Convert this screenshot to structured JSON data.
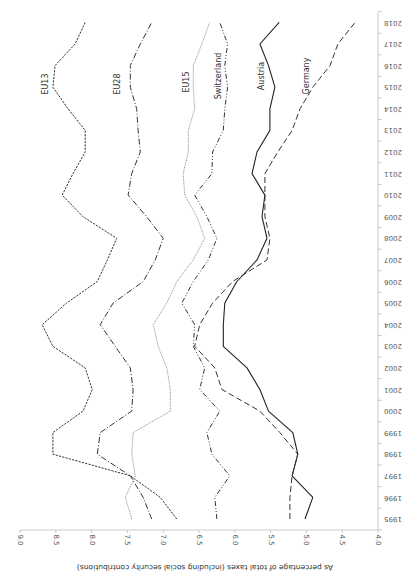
{
  "chart_data": {
    "type": "line",
    "orientation_note": "image rendered rotated 180 degrees",
    "title": "",
    "xlabel": "",
    "ylabel": "As percentage of total taxes (including social security contributions)",
    "x": [
      1995,
      1996,
      1997,
      1998,
      1999,
      2000,
      2001,
      2002,
      2003,
      2004,
      2005,
      2006,
      2007,
      2008,
      2009,
      2010,
      2011,
      2012,
      2013,
      2014,
      2015,
      2016,
      2017,
      2018
    ],
    "x_tick_labels": [
      "1995",
      "1996",
      "1997",
      "1998",
      "1999",
      "2000",
      "2001",
      "2002",
      "2003",
      "2004",
      "2005",
      "2006",
      "2007",
      "2008",
      "2009",
      "2010",
      "2011",
      "2012",
      "2013",
      "2014",
      "2015",
      "2016",
      "2017",
      "2018"
    ],
    "y_ticks": [
      4.0,
      4.5,
      5.0,
      5.5,
      6.0,
      6.5,
      7.0,
      7.5,
      8.0,
      8.5,
      9.0
    ],
    "y_tick_labels": [
      "4.0",
      "4.5",
      "5.0",
      "5.5",
      "6.0",
      "6.5",
      "7.0",
      "7.5",
      "8.0",
      "8.5",
      "9.0"
    ],
    "ylim": [
      4.0,
      9.0
    ],
    "grid": false,
    "legend": "inline labels near top of each line",
    "series": [
      {
        "name": "EU13",
        "style": "short-dash",
        "color": "#333333",
        "values": [
          6.81,
          7.04,
          7.46,
          8.54,
          8.54,
          8.12,
          7.99,
          8.09,
          8.54,
          8.69,
          8.35,
          7.92,
          7.78,
          7.65,
          8.12,
          8.41,
          8.26,
          8.09,
          8.09,
          8.33,
          8.54,
          8.51,
          8.23,
          8.09
        ]
      },
      {
        "name": "EU28",
        "style": "dash-dot",
        "color": "#333333",
        "values": [
          7.16,
          7.28,
          7.46,
          7.92,
          7.88,
          7.44,
          7.42,
          7.46,
          7.67,
          7.88,
          7.7,
          7.28,
          7.11,
          7.0,
          7.23,
          7.49,
          7.44,
          7.32,
          7.35,
          7.37,
          7.46,
          7.46,
          7.32,
          7.16
        ]
      },
      {
        "name": "EU15",
        "style": "dotted",
        "color": "#8a8a8a",
        "values": [
          7.44,
          7.53,
          7.39,
          7.44,
          7.42,
          6.9,
          6.9,
          6.95,
          7.07,
          7.14,
          6.95,
          6.81,
          6.58,
          6.42,
          6.53,
          6.7,
          6.72,
          6.65,
          6.65,
          6.56,
          6.58,
          6.58,
          6.46,
          6.35
        ]
      },
      {
        "name": "Switzerland",
        "style": "dash-dot-dot",
        "color": "#333333",
        "values": [
          6.25,
          6.28,
          6.07,
          6.32,
          6.39,
          6.21,
          6.49,
          6.42,
          6.58,
          6.56,
          6.74,
          6.58,
          6.37,
          6.25,
          6.39,
          6.56,
          6.32,
          6.31,
          6.16,
          6.14,
          6.1,
          6.14,
          6.1,
          6.21
        ]
      },
      {
        "name": "Austria",
        "style": "solid",
        "color": "#222222",
        "values": [
          5.02,
          4.91,
          5.2,
          5.12,
          5.19,
          5.53,
          5.65,
          5.83,
          6.16,
          6.16,
          6.14,
          5.97,
          5.69,
          5.55,
          5.62,
          5.58,
          5.76,
          5.69,
          5.51,
          5.51,
          5.44,
          5.53,
          5.65,
          5.38
        ]
      },
      {
        "name": "Germany",
        "style": "long-dash",
        "color": "#333333",
        "values": [
          5.23,
          5.23,
          5.2,
          5.12,
          5.37,
          5.65,
          6.18,
          6.28,
          6.56,
          6.49,
          6.31,
          6.03,
          5.55,
          5.51,
          5.58,
          5.58,
          5.58,
          5.4,
          5.2,
          5.09,
          4.91,
          4.67,
          4.56,
          4.32
        ]
      }
    ]
  },
  "labels": {
    "axis_title": "As percentage of total taxes (including social security contributions)",
    "series_labels": [
      {
        "text": "EU13",
        "x": 45,
        "y": 84
      },
      {
        "text": "EU28",
        "x": 117,
        "y": 84
      },
      {
        "text": "EU15",
        "x": 186,
        "y": 82
      },
      {
        "text": "Switzerland",
        "x": 218,
        "y": 76
      },
      {
        "text": "Austria",
        "x": 261,
        "y": 76
      },
      {
        "text": "Germany",
        "x": 306,
        "y": 76
      }
    ]
  }
}
